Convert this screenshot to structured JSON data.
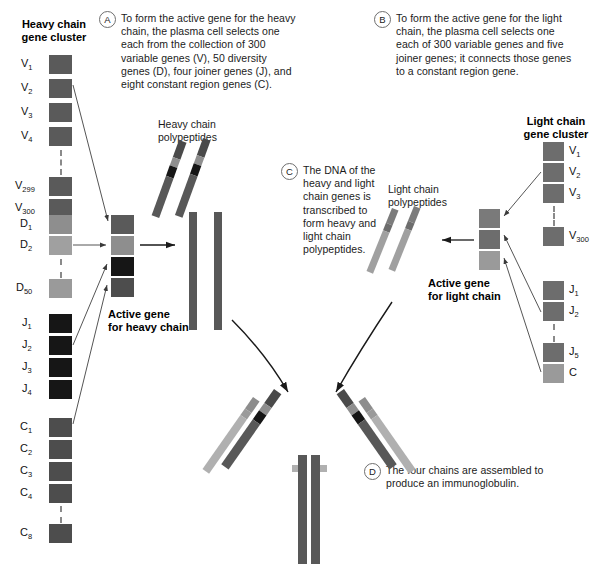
{
  "figure": {
    "steps": [
      {
        "marker": "A",
        "text": "To form the active gene for the heavy chain, the plasma cell selects one each from the collection of 300 variable genes (V), 50 diversity genes (D), four joiner genes (J), and eight constant region genes (C)."
      },
      {
        "marker": "B",
        "text": "To form the active gene for the light chain, the plasma cell selects one each of 300 variable genes and five joiner genes; it connects those genes to a constant region gene."
      },
      {
        "marker": "C",
        "text": "The DNA of the heavy and light chain genes is transcribed to form heavy and light chain polypeptides."
      },
      {
        "marker": "D",
        "text": "The four chains are assembled to produce an immunoglobulin."
      }
    ]
  },
  "heavy_cluster": {
    "title_line1": "Heavy chain",
    "title_line2": "gene cluster",
    "groups": [
      {
        "name": "V",
        "color": "#5a5a5a",
        "genes": [
          {
            "base": "V",
            "sub": "1"
          },
          {
            "base": "V",
            "sub": "2"
          },
          {
            "base": "V",
            "sub": "3"
          },
          {
            "base": "V",
            "sub": "4"
          },
          {
            "base": "V",
            "sub": "299"
          },
          {
            "base": "V",
            "sub": "300"
          }
        ]
      },
      {
        "name": "D",
        "color": "#8e8e8e",
        "genes": [
          {
            "base": "D",
            "sub": "1"
          },
          {
            "base": "D",
            "sub": "2"
          },
          {
            "base": "D",
            "sub": "50"
          }
        ]
      },
      {
        "name": "J",
        "color": "#161616",
        "genes": [
          {
            "base": "J",
            "sub": "1"
          },
          {
            "base": "J",
            "sub": "2"
          },
          {
            "base": "J",
            "sub": "3"
          },
          {
            "base": "J",
            "sub": "4"
          }
        ]
      },
      {
        "name": "C",
        "color": "#4d4d4d",
        "genes": [
          {
            "base": "C",
            "sub": "1"
          },
          {
            "base": "C",
            "sub": "2"
          },
          {
            "base": "C",
            "sub": "3"
          },
          {
            "base": "C",
            "sub": "4"
          },
          {
            "base": "C",
            "sub": "8"
          }
        ]
      }
    ]
  },
  "light_cluster": {
    "title_line1": "Light chain",
    "title_line2": "gene cluster",
    "groups": [
      {
        "name": "V",
        "color": "#6d6d6d",
        "genes": [
          {
            "base": "V",
            "sub": "1"
          },
          {
            "base": "V",
            "sub": "2"
          },
          {
            "base": "V",
            "sub": "3"
          },
          {
            "base": "V",
            "sub": "300"
          }
        ]
      },
      {
        "name": "J",
        "color": "#6d6d6d",
        "genes": [
          {
            "base": "J",
            "sub": "1"
          },
          {
            "base": "J",
            "sub": "2"
          },
          {
            "base": "J",
            "sub": "5"
          }
        ]
      },
      {
        "name": "C",
        "color": "#9a9a9a",
        "genes": [
          {
            "base": "C",
            "sub": ""
          }
        ]
      }
    ]
  },
  "active_heavy": {
    "label_line1": "Active gene",
    "label_line2": "for heavy chain",
    "segments": [
      {
        "name": "V",
        "color": "#5a5a5a"
      },
      {
        "name": "D",
        "color": "#8e8e8e"
      },
      {
        "name": "J",
        "color": "#161616"
      },
      {
        "name": "C",
        "color": "#4d4d4d"
      }
    ]
  },
  "active_light": {
    "label_line1": "Active gene",
    "label_line2": "for light chain",
    "segments": [
      {
        "name": "V",
        "color": "#7a7a7a"
      },
      {
        "name": "J",
        "color": "#6d6d6d"
      },
      {
        "name": "C",
        "color": "#9a9a9a"
      }
    ]
  },
  "heavy_polypeptide": {
    "label_line1": "Heavy chain",
    "label_line2": "polypeptides",
    "colors": {
      "variable": "#5a5a5a",
      "diversity": "#8e8e8e",
      "joiner": "#161616",
      "constant": "#585858"
    }
  },
  "light_polypeptide": {
    "label_line1": "Light chain",
    "label_line2": "polypeptides",
    "colors": {
      "variable": "#7c7c7c",
      "joiner": "#6d6d6d",
      "constant": "#a0a0a0"
    }
  },
  "immunoglobulin": {
    "heavy_chain_color": "#585858",
    "light_chain_color": "#a6a6a6",
    "joiner_band_color": "#161616",
    "diversity_band_color": "#8e8e8e",
    "variable_band_color": "#4a4a4a"
  },
  "colors": {
    "background": "#ffffff",
    "text": "#1b1b1b",
    "line": "#6e6e6e",
    "dash": "#8a8a8a"
  }
}
